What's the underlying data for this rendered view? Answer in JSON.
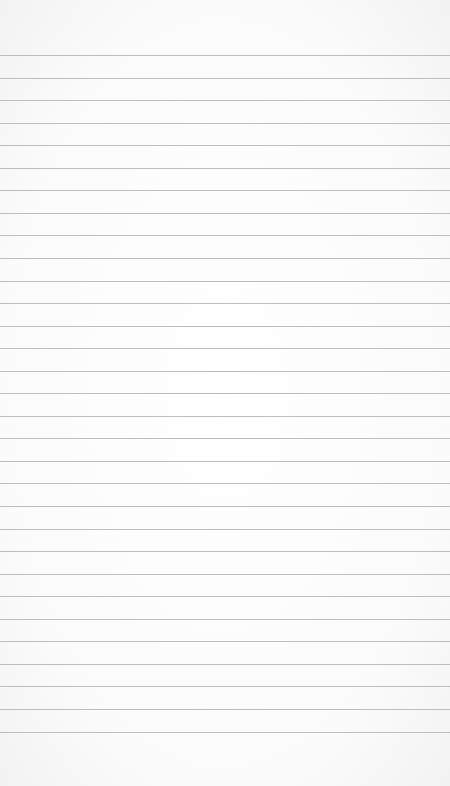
{
  "paper": {
    "background": "#fdfdfd",
    "rule_color": "#bdbdbd",
    "first_rule_y": 55,
    "rule_spacing": 22.55,
    "rule_count": 31
  }
}
